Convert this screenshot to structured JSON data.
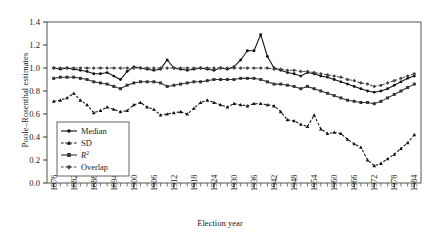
{
  "chart_data": {
    "type": "line",
    "title": "",
    "xlabel": "Election year",
    "ylabel": "Poole–Rosenthal estimates",
    "xlim": [
      1874,
      1986
    ],
    "ylim": [
      0.0,
      1.4
    ],
    "ytick_labels": [
      "0.0",
      "0.2",
      "0.4",
      "0.6",
      "0.8",
      "1.0",
      "1.2",
      "1.4"
    ],
    "ytick_values": [
      0.0,
      0.2,
      0.4,
      0.6,
      0.8,
      1.0,
      1.2,
      1.4
    ],
    "xtick_labels": [
      "1876",
      "1882",
      "1888",
      "1894",
      "1900",
      "1906",
      "1912",
      "1918",
      "1924",
      "1930",
      "1936",
      "1942",
      "1948",
      "1954",
      "1960",
      "1966",
      "1972",
      "1978",
      "1984"
    ],
    "xtick_values": [
      1876,
      1882,
      1888,
      1894,
      1900,
      1906,
      1912,
      1918,
      1924,
      1930,
      1936,
      1942,
      1948,
      1954,
      1960,
      1966,
      1972,
      1978,
      1984
    ],
    "minor_tick_step": 2,
    "grid": false,
    "legend_position": "inside-lower-left",
    "legend": [
      "Median",
      "SD",
      "R²",
      "Overlap"
    ],
    "x": [
      1876,
      1878,
      1880,
      1882,
      1884,
      1886,
      1888,
      1890,
      1892,
      1894,
      1896,
      1898,
      1900,
      1902,
      1904,
      1906,
      1908,
      1910,
      1912,
      1914,
      1916,
      1918,
      1920,
      1922,
      1924,
      1926,
      1928,
      1930,
      1932,
      1934,
      1936,
      1938,
      1940,
      1942,
      1944,
      1946,
      1948,
      1950,
      1952,
      1954,
      1956,
      1958,
      1960,
      1962,
      1964,
      1966,
      1968,
      1970,
      1972,
      1974,
      1976,
      1978,
      1980,
      1982,
      1984
    ],
    "series": [
      {
        "name": "Median",
        "marker": "circle",
        "dash": "solid",
        "color": "#111111",
        "values": [
          1.0,
          0.99,
          1.0,
          0.99,
          0.98,
          0.97,
          0.95,
          0.95,
          0.96,
          0.93,
          0.9,
          0.97,
          1.01,
          1.0,
          0.99,
          0.98,
          0.99,
          1.07,
          1.0,
          0.99,
          0.98,
          0.99,
          1.0,
          0.99,
          0.98,
          1.0,
          0.99,
          1.01,
          1.07,
          1.15,
          1.15,
          1.29,
          1.1,
          1.0,
          0.98,
          0.96,
          0.95,
          0.93,
          0.96,
          0.95,
          0.93,
          0.92,
          0.9,
          0.88,
          0.86,
          0.84,
          0.82,
          0.8,
          0.79,
          0.8,
          0.82,
          0.85,
          0.88,
          0.91,
          0.93
        ]
      },
      {
        "name": "SD",
        "marker": "triangle",
        "dash": "dashed",
        "color": "#111111",
        "values": [
          0.71,
          0.72,
          0.74,
          0.78,
          0.72,
          0.68,
          0.61,
          0.63,
          0.66,
          0.64,
          0.62,
          0.63,
          0.68,
          0.7,
          0.66,
          0.64,
          0.59,
          0.6,
          0.61,
          0.62,
          0.6,
          0.65,
          0.7,
          0.72,
          0.7,
          0.68,
          0.66,
          0.69,
          0.68,
          0.67,
          0.69,
          0.69,
          0.68,
          0.67,
          0.62,
          0.55,
          0.54,
          0.51,
          0.49,
          0.59,
          0.47,
          0.43,
          0.44,
          0.43,
          0.38,
          0.34,
          0.31,
          0.2,
          0.15,
          0.17,
          0.21,
          0.25,
          0.3,
          0.35,
          0.42
        ]
      },
      {
        "name": "R²",
        "marker": "square",
        "dash": "solid",
        "color": "#333333",
        "values": [
          0.91,
          0.92,
          0.92,
          0.92,
          0.91,
          0.9,
          0.88,
          0.87,
          0.86,
          0.84,
          0.82,
          0.85,
          0.87,
          0.88,
          0.88,
          0.88,
          0.87,
          0.84,
          0.85,
          0.86,
          0.87,
          0.88,
          0.88,
          0.89,
          0.9,
          0.9,
          0.9,
          0.9,
          0.91,
          0.91,
          0.91,
          0.9,
          0.88,
          0.86,
          0.86,
          0.85,
          0.84,
          0.82,
          0.84,
          0.82,
          0.8,
          0.78,
          0.76,
          0.74,
          0.72,
          0.71,
          0.7,
          0.7,
          0.69,
          0.71,
          0.74,
          0.77,
          0.8,
          0.83,
          0.86
        ]
      },
      {
        "name": "Overlap",
        "marker": "diamond",
        "dash": "dashed",
        "color": "#444444",
        "values": [
          1.0,
          1.0,
          1.0,
          1.0,
          1.0,
          1.0,
          1.0,
          1.0,
          1.0,
          1.0,
          1.0,
          1.0,
          1.0,
          1.0,
          1.0,
          1.0,
          1.0,
          1.0,
          1.0,
          1.0,
          1.0,
          1.0,
          1.0,
          1.0,
          1.0,
          1.0,
          1.0,
          1.0,
          1.0,
          1.0,
          1.0,
          1.0,
          1.0,
          0.99,
          0.99,
          0.98,
          0.98,
          0.97,
          0.97,
          0.96,
          0.95,
          0.94,
          0.93,
          0.92,
          0.9,
          0.89,
          0.87,
          0.86,
          0.84,
          0.85,
          0.87,
          0.89,
          0.91,
          0.93,
          0.95
        ]
      }
    ]
  },
  "axes": {
    "frame_color": "#555555"
  }
}
